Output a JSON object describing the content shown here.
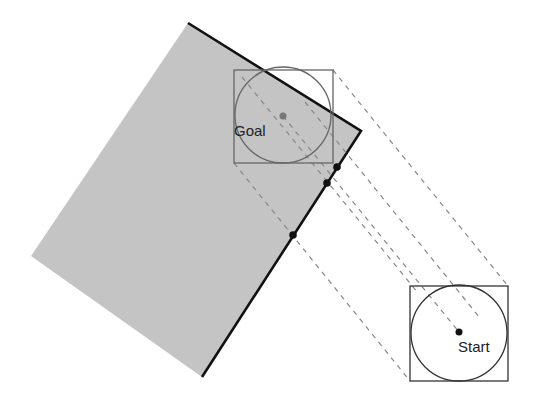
{
  "diagram": {
    "title": "",
    "colors": {
      "obstacle_fill": "#c4c4c4",
      "obstacle_edge": "#111111",
      "goal_box": "#666666",
      "start_box": "#333333",
      "dashed": "#888888",
      "contact_point": "#111111",
      "goal_center": "#777777",
      "start_center": "#111111"
    },
    "obstacle": {
      "points": "188,23 361,131 202,377 31,256"
    },
    "goal": {
      "label": "Goal",
      "box": {
        "x": 234,
        "y": 70,
        "w": 99,
        "h": 93
      },
      "circle": {
        "cx": 283,
        "cy": 115,
        "r": 48
      },
      "center": {
        "x": 283,
        "y": 116
      }
    },
    "start": {
      "label": "Start",
      "box": {
        "x": 410,
        "y": 286,
        "w": 98,
        "h": 95
      },
      "circle": {
        "cx": 459,
        "cy": 333,
        "r": 48
      },
      "center": {
        "x": 459,
        "y": 332
      }
    },
    "sweep_lines": [
      {
        "x1": 333,
        "y1": 70,
        "x2": 508,
        "y2": 286
      },
      {
        "x1": 234,
        "y1": 163,
        "x2": 410,
        "y2": 381
      },
      {
        "x1": 242,
        "y1": 77,
        "x2": 418,
        "y2": 293
      },
      {
        "x1": 283,
        "y1": 116,
        "x2": 459,
        "y2": 332
      },
      {
        "x1": 305,
        "y1": 102,
        "x2": 480,
        "y2": 318
      }
    ],
    "contact_points": [
      {
        "x": 337,
        "y": 167
      },
      {
        "x": 327,
        "y": 183
      },
      {
        "x": 293,
        "y": 235
      }
    ]
  }
}
